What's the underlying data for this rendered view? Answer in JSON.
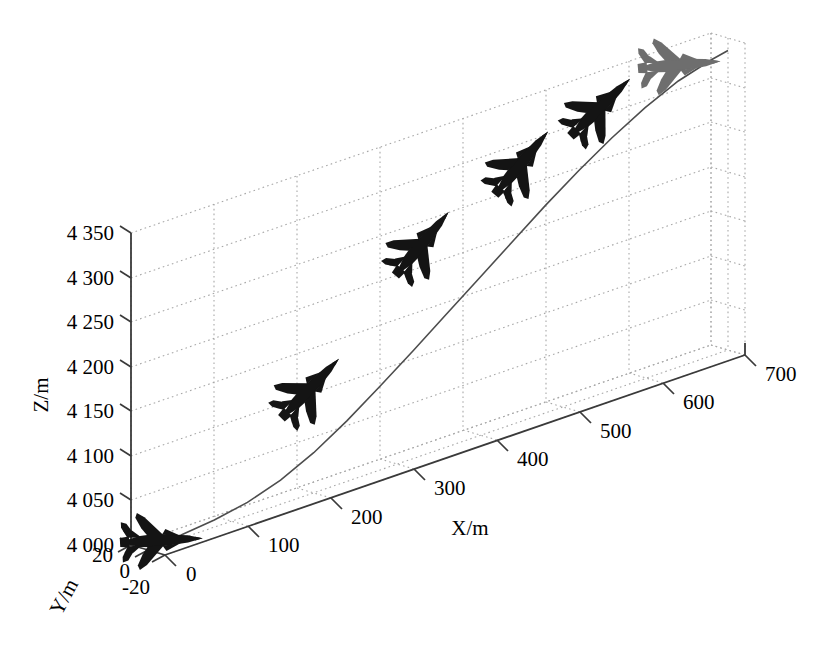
{
  "chart_data": {
    "type": "line",
    "title": "",
    "subtitle": "",
    "projection": "3d",
    "xlabel": "X/m",
    "ylabel": "Y/m",
    "zlabel": "Z/m",
    "xlim": [
      0,
      700
    ],
    "ylim": [
      -20,
      20
    ],
    "zlim": [
      4000,
      4350
    ],
    "xticks": [
      "0",
      "100",
      "200",
      "300",
      "400",
      "500",
      "600",
      "700"
    ],
    "yticks": [
      "20",
      "0",
      "-20"
    ],
    "zticks": [
      "4 000",
      "4 050",
      "4 100",
      "4 150",
      "4 200",
      "4 250",
      "4 300",
      "4 350"
    ],
    "grid": true,
    "legend": "none",
    "series": [
      {
        "name": "flight trajectory",
        "color": "#4d4d4d",
        "x": [
          0,
          40,
          80,
          120,
          160,
          200,
          240,
          280,
          320,
          360,
          400,
          440,
          480,
          520,
          560,
          600,
          640,
          680,
          700
        ],
        "y": [
          0,
          0,
          0,
          0,
          0,
          0,
          0,
          0,
          0,
          0,
          0,
          0,
          0,
          0,
          0,
          0,
          0,
          0,
          0
        ],
        "z": [
          4002,
          4004,
          4008,
          4015,
          4027,
          4045,
          4068,
          4094,
          4121,
          4149,
          4177,
          4205,
          4233,
          4259,
          4283,
          4304,
          4321,
          4332,
          4336
        ]
      }
    ],
    "markers": [
      {
        "name": "aircraft-1",
        "x": 15,
        "y": 0,
        "z": 4006,
        "pitch_deg": 3,
        "shade": "dark"
      },
      {
        "name": "aircraft-2",
        "x": 195,
        "y": 0,
        "z": 4118,
        "pitch_deg": 46,
        "shade": "dark"
      },
      {
        "name": "aircraft-3",
        "x": 330,
        "y": 0,
        "z": 4237,
        "pitch_deg": 50,
        "shade": "dark"
      },
      {
        "name": "aircraft-4",
        "x": 450,
        "y": 0,
        "z": 4289,
        "pitch_deg": 50,
        "shade": "dark"
      },
      {
        "name": "aircraft-5",
        "x": 545,
        "y": 0,
        "z": 4321,
        "pitch_deg": 44,
        "shade": "dark"
      },
      {
        "name": "aircraft-6",
        "x": 640,
        "y": 0,
        "z": 4339,
        "pitch_deg": 5,
        "shade": "light"
      }
    ],
    "annotations": []
  },
  "axes": {
    "z_title": "Z/m",
    "x_title": "X/m",
    "y_title": "Y/m",
    "z_ticks": [
      {
        "label": "4 350"
      },
      {
        "label": "4 300"
      },
      {
        "label": "4 250"
      },
      {
        "label": "4 200"
      },
      {
        "label": "4 150"
      },
      {
        "label": "4 100"
      },
      {
        "label": "4 050"
      },
      {
        "label": "4 000"
      }
    ],
    "x_ticks": [
      {
        "label": "0"
      },
      {
        "label": "100"
      },
      {
        "label": "200"
      },
      {
        "label": "300"
      },
      {
        "label": "400"
      },
      {
        "label": "500"
      },
      {
        "label": "600"
      },
      {
        "label": "700"
      }
    ],
    "y_ticks": [
      {
        "label": "20"
      },
      {
        "label": "0"
      },
      {
        "label": "-20"
      }
    ]
  },
  "style": {
    "axis_color": "#3a3a3a",
    "grid_color": "#a8a8a8",
    "curve_color": "#555555",
    "marker_dark": "#141414",
    "marker_light": "#6e6e6e",
    "background": "#ffffff"
  }
}
